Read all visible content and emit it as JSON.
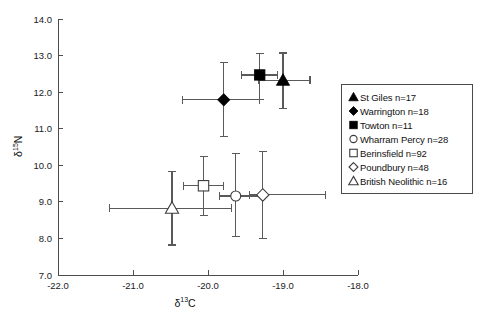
{
  "chart_data": {
    "type": "scatter",
    "title": "",
    "xlabel": "δ13C",
    "ylabel": "δ15N",
    "xlim": [
      -22.0,
      -18.0
    ],
    "ylim": [
      7.0,
      14.0
    ],
    "xticks": [
      "-22.0",
      "-21.0",
      "-20.0",
      "-19.0",
      "-18.0"
    ],
    "yticks": [
      "7.0",
      "8.0",
      "9.0",
      "10.0",
      "11.0",
      "12.0",
      "13.0",
      "14.0"
    ],
    "xtick_values": [
      -22.0,
      -21.0,
      -20.0,
      -19.0,
      -18.0
    ],
    "ytick_values": [
      7.0,
      8.0,
      9.0,
      10.0,
      11.0,
      12.0,
      13.0,
      14.0
    ],
    "grid": false,
    "legend_position": "right",
    "error_bars": "both-axes",
    "series": [
      {
        "name": "St Giles",
        "n": 17,
        "legend_label": "St Giles n=17",
        "marker": "triangle-filled",
        "x": -19.0,
        "y": 12.33,
        "x_err_low": -19.32,
        "x_err_high": -18.64,
        "y_err_low": 11.55,
        "y_err_high": 13.07
      },
      {
        "name": "Warrington",
        "n": 18,
        "legend_label": "Warrington n=18",
        "marker": "diamond-filled",
        "x": -19.79,
        "y": 11.79,
        "x_err_low": -20.34,
        "x_err_high": -19.31,
        "y_err_low": 10.78,
        "y_err_high": 12.81
      },
      {
        "name": "Towton",
        "n": 11,
        "legend_label": "Towton n=11",
        "marker": "square-filled",
        "x": -19.31,
        "y": 12.47,
        "x_err_low": -19.55,
        "x_err_high": -19.07,
        "y_err_low": 11.79,
        "y_err_high": 13.05
      },
      {
        "name": "Wharram Percy",
        "n": 28,
        "legend_label": "Wharram Percy n=28",
        "marker": "circle-open",
        "x": -19.63,
        "y": 9.16,
        "x_err_low": -19.85,
        "x_err_high": -19.25,
        "y_err_low": 8.06,
        "y_err_high": 10.31
      },
      {
        "name": "Berinsfield",
        "n": 92,
        "legend_label": "Berinsfield n=92",
        "marker": "square-open",
        "x": -20.06,
        "y": 9.44,
        "x_err_low": -20.33,
        "x_err_high": -19.79,
        "y_err_low": 8.63,
        "y_err_high": 10.24
      },
      {
        "name": "Poundbury",
        "n": 48,
        "legend_label": "Poundbury n=48",
        "marker": "diamond-open",
        "x": -19.27,
        "y": 9.19,
        "x_err_low": -19.45,
        "x_err_high": -18.43,
        "y_err_low": 8.01,
        "y_err_high": 10.38
      },
      {
        "name": "British Neolithic",
        "n": 16,
        "legend_label": "British Neolithic n=16",
        "marker": "triangle-open",
        "x": -20.48,
        "y": 8.83,
        "x_err_low": -21.31,
        "x_err_high": -19.69,
        "y_err_low": 7.82,
        "y_err_high": 9.82
      }
    ]
  },
  "legend": {
    "items": [
      {
        "label": "St Giles n=17",
        "marker": "triangle-filled"
      },
      {
        "label": "Warrington n=18",
        "marker": "diamond-filled"
      },
      {
        "label": "Towton n=11",
        "marker": "square-filled"
      },
      {
        "label": "Wharram Percy n=28",
        "marker": "circle-open"
      },
      {
        "label": "Berinsfield n=92",
        "marker": "square-open"
      },
      {
        "label": "Poundbury n=48",
        "marker": "diamond-open"
      },
      {
        "label": "British Neolithic n=16",
        "marker": "triangle-open"
      }
    ]
  },
  "axes": {
    "x_title_main": "δ",
    "x_title_sup": "13",
    "x_title_tail": "C",
    "y_title_main": "δ",
    "y_title_sup": "15",
    "y_title_tail": "N"
  }
}
